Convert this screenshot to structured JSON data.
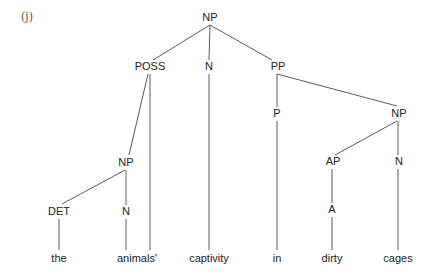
{
  "diagram": {
    "type": "syntax-tree",
    "example_label": "(j)",
    "colors": {
      "line": "#5a5a5a",
      "text": "#222222",
      "label": "#555555"
    },
    "nodes": [
      {
        "id": "np_root",
        "label": "NP",
        "x": 210,
        "y": 18
      },
      {
        "id": "poss",
        "label": "POSS",
        "x": 150,
        "y": 67
      },
      {
        "id": "n_captivity",
        "label": "N",
        "x": 209,
        "y": 67
      },
      {
        "id": "pp",
        "label": "PP",
        "x": 278,
        "y": 67
      },
      {
        "id": "p",
        "label": "P",
        "x": 277,
        "y": 114
      },
      {
        "id": "np_right",
        "label": "NP",
        "x": 399,
        "y": 114
      },
      {
        "id": "np_inner",
        "label": "NP",
        "x": 126,
        "y": 163
      },
      {
        "id": "ap",
        "label": "AP",
        "x": 333,
        "y": 162
      },
      {
        "id": "n_cages",
        "label": "N",
        "x": 399,
        "y": 162
      },
      {
        "id": "det",
        "label": "DET",
        "x": 59,
        "y": 212
      },
      {
        "id": "n_animals",
        "label": "N",
        "x": 126,
        "y": 212
      },
      {
        "id": "a",
        "label": "A",
        "x": 332,
        "y": 210
      }
    ],
    "leaves": [
      {
        "id": "w_the",
        "label": "the",
        "x": 59,
        "y": 259
      },
      {
        "id": "w_animals",
        "label": "animals'",
        "x": 137,
        "y": 259
      },
      {
        "id": "w_captivity",
        "label": "captivity",
        "x": 209,
        "y": 259
      },
      {
        "id": "w_in",
        "label": "in",
        "x": 277,
        "y": 259
      },
      {
        "id": "w_dirty",
        "label": "dirty",
        "x": 332,
        "y": 259
      },
      {
        "id": "w_cages",
        "label": "cages",
        "x": 398,
        "y": 259
      }
    ],
    "edges": [
      {
        "from": "np_root",
        "to": "poss",
        "x1": 210,
        "y1": 25,
        "x2": 153,
        "y2": 60
      },
      {
        "from": "np_root",
        "to": "n_captivity",
        "x1": 210,
        "y1": 25,
        "x2": 209,
        "y2": 60
      },
      {
        "from": "np_root",
        "to": "pp",
        "x1": 210,
        "y1": 25,
        "x2": 272,
        "y2": 60
      },
      {
        "from": "poss",
        "to": "np_inner",
        "x1": 148,
        "y1": 74,
        "x2": 129,
        "y2": 155
      },
      {
        "from": "poss",
        "to": "w_animals",
        "x1": 150,
        "y1": 74,
        "x2": 150,
        "y2": 250
      },
      {
        "from": "n_captivity",
        "to": "w_captivity",
        "x1": 209,
        "y1": 74,
        "x2": 209,
        "y2": 250
      },
      {
        "from": "pp",
        "to": "p",
        "x1": 277,
        "y1": 74,
        "x2": 277,
        "y2": 107
      },
      {
        "from": "pp",
        "to": "np_right",
        "x1": 277,
        "y1": 74,
        "x2": 397,
        "y2": 106
      },
      {
        "from": "p",
        "to": "w_in",
        "x1": 277,
        "y1": 121,
        "x2": 277,
        "y2": 250
      },
      {
        "from": "np_right",
        "to": "ap",
        "x1": 397,
        "y1": 121,
        "x2": 335,
        "y2": 155
      },
      {
        "from": "np_right",
        "to": "n_cages",
        "x1": 398,
        "y1": 121,
        "x2": 398,
        "y2": 155
      },
      {
        "from": "np_inner",
        "to": "det",
        "x1": 125,
        "y1": 170,
        "x2": 62,
        "y2": 204
      },
      {
        "from": "np_inner",
        "to": "n_animals",
        "x1": 126,
        "y1": 170,
        "x2": 126,
        "y2": 205
      },
      {
        "from": "ap",
        "to": "a",
        "x1": 332,
        "y1": 169,
        "x2": 332,
        "y2": 203
      },
      {
        "from": "n_cages",
        "to": "w_cages",
        "x1": 398,
        "y1": 169,
        "x2": 398,
        "y2": 250
      },
      {
        "from": "det",
        "to": "w_the",
        "x1": 59,
        "y1": 219,
        "x2": 59,
        "y2": 250
      },
      {
        "from": "n_animals",
        "to": "w_animals",
        "x1": 126,
        "y1": 219,
        "x2": 126,
        "y2": 250
      },
      {
        "from": "a",
        "to": "w_dirty",
        "x1": 332,
        "y1": 217,
        "x2": 332,
        "y2": 250
      }
    ]
  }
}
